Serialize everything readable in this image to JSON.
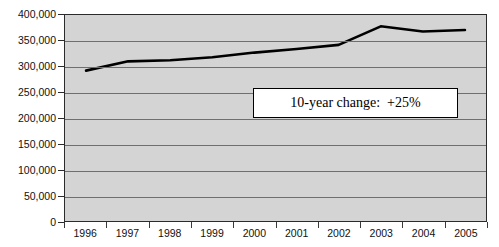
{
  "chart_data": {
    "type": "line",
    "title": "",
    "subtitle": "",
    "xlabel": "",
    "ylabel": "",
    "categories": [
      "1996",
      "1997",
      "1998",
      "1999",
      "2000",
      "2001",
      "2002",
      "2003",
      "2004",
      "2005"
    ],
    "values": [
      292000,
      310000,
      312000,
      318000,
      327000,
      334000,
      342000,
      378000,
      368000,
      371000
    ],
    "series": [
      {
        "name": "",
        "values": [
          292000,
          310000,
          312000,
          318000,
          327000,
          334000,
          342000,
          378000,
          368000,
          371000
        ]
      }
    ],
    "ylim": [
      0,
      400000
    ],
    "y_ticks": [
      0,
      50000,
      100000,
      150000,
      200000,
      250000,
      300000,
      350000,
      400000
    ],
    "y_tick_labels": [
      "0",
      "50,000",
      "100,000",
      "150,000",
      "200,000",
      "250,000",
      "300,000",
      "350,000",
      "400,000"
    ],
    "x_tick_labels": [
      "1996",
      "1997",
      "1998",
      "1999",
      "2000",
      "2001",
      "2002",
      "2003",
      "2004",
      "2005"
    ],
    "grid": true,
    "grid_orientation": "horizontal",
    "legend": false,
    "legend_position": "none",
    "annotations": [
      {
        "text": "10-year change:  +25%",
        "style": "boxed-callout"
      }
    ]
  },
  "annotation": {
    "text": "10-year change:  +25%"
  },
  "colors": {
    "plot_background": "#d4d4d4",
    "gridline": "#6f6f6f",
    "axis": "#2b2b2b",
    "line": "#000000",
    "annotation_background": "#ffffff",
    "annotation_border": "#000000",
    "page_background": "#ffffff",
    "text": "#111111"
  }
}
